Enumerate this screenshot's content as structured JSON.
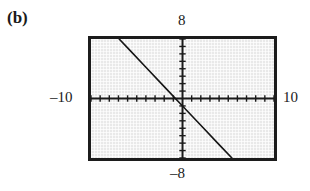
{
  "figure": {
    "part_label": "(b)"
  },
  "window_labels": {
    "ymax": "8",
    "ymin": "–8",
    "xmin": "–10",
    "xmax": "10"
  },
  "colors": {
    "screen_background": "#e9e9e9",
    "frame": "#1c1c1c",
    "axis": "#1a1a1a",
    "curve": "#141414",
    "text": "#1a1a1a"
  },
  "chart_data": {
    "type": "line",
    "title": "",
    "subtitle": "",
    "xlabel": "",
    "ylabel": "",
    "xlim": [
      -10,
      10
    ],
    "ylim": [
      -8,
      8
    ],
    "xscl": 1,
    "yscl": 1,
    "grid": false,
    "axes_shown": true,
    "tick_marks": true,
    "legend": null,
    "annotations": [],
    "series": [
      {
        "name": "line",
        "equation": "y = -1.3x - 1",
        "slope": -1.3,
        "intercept": -1,
        "x": [
          -10,
          -8,
          -6,
          -4,
          -2,
          0,
          2,
          4,
          5.4
        ],
        "y": [
          12,
          9.4,
          6.8,
          4.2,
          1.6,
          -1,
          -3.6,
          -6.2,
          -8
        ],
        "x_intercept": -0.77,
        "y_intercept": -1,
        "visible_x_from": -9.6,
        "visible_x_to": 5.4
      }
    ],
    "x_ticks": [
      -10,
      -9,
      -8,
      -7,
      -6,
      -5,
      -4,
      -3,
      -2,
      -1,
      0,
      1,
      2,
      3,
      4,
      5,
      6,
      7,
      8,
      9,
      10
    ],
    "y_ticks": [
      -8,
      -7,
      -6,
      -5,
      -4,
      -3,
      -2,
      -1,
      0,
      1,
      2,
      3,
      4,
      5,
      6,
      7,
      8
    ],
    "x_tick_labels": [
      "-10",
      "10"
    ],
    "y_tick_labels": [
      "-8",
      "8"
    ]
  }
}
